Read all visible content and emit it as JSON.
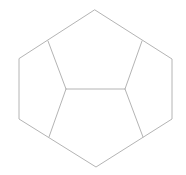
{
  "diagram": {
    "type": "geometric-dissection",
    "width": 186,
    "height": 175,
    "background": "#ffffff",
    "stroke_color": "#b4b4b4",
    "stroke_width": 1,
    "points": {
      "top": [
        95,
        10
      ],
      "upper_right": [
        172,
        59
      ],
      "lower_right": [
        172,
        119
      ],
      "bottom": [
        96,
        167
      ],
      "lower_left": [
        19,
        119
      ],
      "upper_left": [
        19,
        59
      ],
      "edge_top_left": [
        48,
        41
      ],
      "edge_top_right": [
        142,
        41
      ],
      "edge_bottom_left": [
        49,
        137
      ],
      "edge_bottom_right": [
        143,
        137
      ],
      "inner_left": [
        66,
        89
      ],
      "inner_right": [
        125,
        89
      ]
    },
    "outline": [
      "top",
      "upper_right",
      "lower_right",
      "bottom",
      "lower_left",
      "upper_left"
    ],
    "segments": [
      [
        "edge_top_left",
        "inner_left"
      ],
      [
        "edge_top_right",
        "inner_right"
      ],
      [
        "inner_left",
        "inner_right"
      ],
      [
        "inner_left",
        "edge_bottom_left"
      ],
      [
        "inner_right",
        "edge_bottom_right"
      ]
    ],
    "regions": [
      {
        "name": "top-pentagon",
        "vertices": [
          "top",
          "edge_top_right",
          "inner_right",
          "inner_left",
          "edge_top_left"
        ]
      },
      {
        "name": "bottom-pentagon",
        "vertices": [
          "inner_left",
          "inner_right",
          "edge_bottom_right",
          "bottom",
          "edge_bottom_left"
        ]
      },
      {
        "name": "left-pentagon",
        "vertices": [
          "upper_left",
          "edge_top_left",
          "inner_left",
          "edge_bottom_left",
          "lower_left"
        ]
      },
      {
        "name": "right-pentagon",
        "vertices": [
          "edge_top_right",
          "upper_right",
          "lower_right",
          "edge_bottom_right",
          "inner_right"
        ]
      }
    ]
  }
}
